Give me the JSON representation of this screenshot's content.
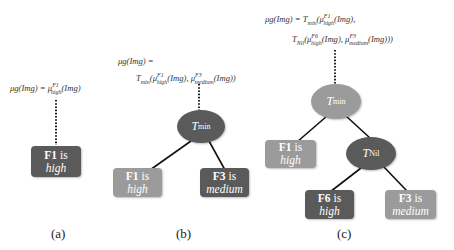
{
  "colors": {
    "dark_node": "#5a5a5a",
    "light_node": "#9b9b9b",
    "edge": "#111111",
    "background": "#ffffff"
  },
  "panel_a": {
    "equation": {
      "lhs": "μg(Img) = ",
      "mu": "μ",
      "sup": "F1",
      "sub": "high",
      "arg": "(Img)"
    },
    "leaf": {
      "feature": "F1",
      "is": "is",
      "value": "high"
    },
    "caption": "(a)"
  },
  "panel_b": {
    "equation_line1": "μg(Img) =",
    "equation_line2": {
      "op": "T",
      "op_sub": "min",
      "term1_sup": "F1",
      "term1_sub": "high",
      "term2_sup": "F3",
      "term2_sub": "medium",
      "arg": "(Img)"
    },
    "root": {
      "label": "T",
      "sub": "min"
    },
    "leaves": [
      {
        "feature": "F1",
        "is": "is",
        "value": "high"
      },
      {
        "feature": "F3",
        "is": "is",
        "value": "medium"
      }
    ],
    "caption": "(b)"
  },
  "panel_c": {
    "equation_line1": {
      "lhs": "μg(Img) = ",
      "op": "T",
      "op_sub": "min",
      "term1_sup": "F1",
      "term1_sub": "high",
      "arg": "(Img),"
    },
    "equation_line2": {
      "op": "T",
      "op_sub": "Nil",
      "term1_sup": "F6",
      "term1_sub": "high",
      "term2_sup": "F3",
      "term2_sub": "medium",
      "arg": "(Img)"
    },
    "root": {
      "label": "T",
      "sub": "min"
    },
    "inner": {
      "label": "T",
      "sub": "Nil"
    },
    "leaves": [
      {
        "feature": "F1",
        "is": "is",
        "value": "high"
      },
      {
        "feature": "F6",
        "is": "is",
        "value": "high"
      },
      {
        "feature": "F3",
        "is": "is",
        "value": "medium"
      }
    ],
    "caption": "(c)"
  }
}
